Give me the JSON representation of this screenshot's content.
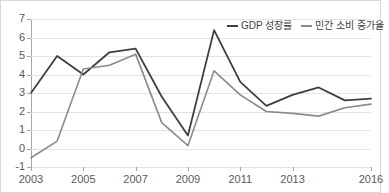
{
  "chart_data": {
    "type": "line",
    "title": "",
    "xlabel": "",
    "ylabel": "",
    "x": [
      2003,
      2004,
      2005,
      2006,
      2007,
      2008,
      2009,
      2010,
      2011,
      2012,
      2013,
      2014,
      2015,
      2016
    ],
    "xtick_labels": [
      "2003",
      "2005",
      "2007",
      "2009",
      "2011",
      "2013",
      "2016"
    ],
    "xtick_values": [
      2003,
      2005,
      2007,
      2009,
      2011,
      2013,
      2016
    ],
    "ytick_labels": [
      "7",
      "6",
      "5",
      "4",
      "3",
      "2",
      "1",
      "0",
      "-1"
    ],
    "ytick_values": [
      7,
      6,
      5,
      4,
      3,
      2,
      1,
      0,
      -1
    ],
    "ylim": [
      -1,
      7
    ],
    "xlim": [
      2003,
      2016
    ],
    "grid": true,
    "legend_position": "top-right",
    "series": [
      {
        "name": "GDP 성장률",
        "color": "#3f3f3f",
        "values": [
          3.0,
          5.0,
          4.0,
          5.2,
          5.4,
          2.8,
          0.7,
          6.4,
          3.6,
          2.3,
          2.9,
          3.3,
          2.6,
          2.7
        ]
      },
      {
        "name": "민간 소비 증가율",
        "color": "#8a8a8a",
        "values": [
          -0.5,
          0.4,
          4.3,
          4.5,
          5.1,
          1.4,
          0.15,
          4.2,
          2.9,
          2.0,
          1.9,
          1.75,
          2.2,
          2.4
        ]
      }
    ]
  }
}
